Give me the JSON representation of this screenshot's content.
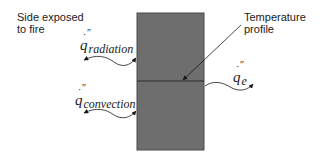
{
  "diagram": {
    "labels": {
      "side_exposed": "Side exposed\nto fire",
      "temperature_profile": "Temperature\nprofile"
    },
    "fluxes": {
      "radiation": {
        "symbol": "q",
        "dot": "·",
        "primes": "″",
        "subscript": "radiation"
      },
      "convection": {
        "symbol": "q",
        "dot": "·",
        "primes": "″",
        "subscript": "convection"
      },
      "exit": {
        "symbol": "q",
        "dot": "·",
        "primes": "″",
        "subscript": "e"
      }
    },
    "colors": {
      "block_fill": "#6e6e6e",
      "block_stroke": "#4a4a4a",
      "line": "#1a1a1a"
    }
  }
}
